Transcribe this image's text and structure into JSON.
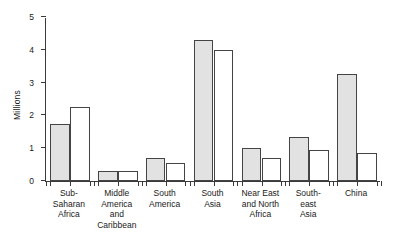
{
  "chart_data": {
    "type": "bar",
    "title": "",
    "xlabel": "",
    "ylabel": "Millions",
    "ylim": [
      0,
      5
    ],
    "yticks": [
      0,
      1,
      2,
      3,
      4,
      5
    ],
    "ytick_labels": [
      "0",
      "1",
      "2",
      "3",
      "4",
      "5"
    ],
    "grid": false,
    "legend": "none",
    "categories": [
      "Sub-\nSaharan\nAfrica",
      "Middle\nAmerica\nand\nCaribbean",
      "South\nAmerica",
      "South\nAsia",
      "Near East\nand North\nAfrica",
      "South-\neast\nAsia",
      "China"
    ],
    "series": [
      {
        "name": "shaded",
        "fill": "#e2e2e2",
        "values": [
          1.75,
          0.32,
          0.7,
          4.3,
          1.0,
          1.35,
          3.25
        ]
      },
      {
        "name": "open",
        "fill": "#ffffff",
        "values": [
          2.25,
          0.32,
          0.55,
          4.0,
          0.7,
          0.95,
          0.85
        ]
      }
    ],
    "colors": {
      "axis": "#3a3a3a",
      "bar_edge": "#444444",
      "bar_shaded": "#e2e2e2",
      "bar_open": "#ffffff",
      "background": "#ffffff",
      "text": "#1a1a1a"
    }
  }
}
